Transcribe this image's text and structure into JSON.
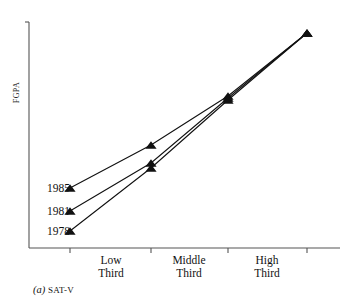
{
  "chart_data": {
    "type": "line",
    "title": "",
    "subtitle": "",
    "caption_prefix": "(a)",
    "caption_text": "SAT-V",
    "xlabel": "",
    "ylabel": "FGPA",
    "grid": false,
    "legend_position": "inline-left",
    "categories": [
      "",
      "Low Third",
      "Middle Third",
      "High Third"
    ],
    "tick_labels": [
      "Low Third",
      "Middle Third",
      "High Third"
    ],
    "x_ticks": [
      70,
      151,
      228,
      307
    ],
    "axis": {
      "x_start": 29,
      "x_end": 340,
      "y_top": 22,
      "y_bottom": 248,
      "y_tick_top": true,
      "y_tick_labels": []
    },
    "series": [
      {
        "name": "1985",
        "color": "#111111",
        "marker": "triangle-up",
        "label_x": 30,
        "label_y": 182,
        "points": [
          {
            "x": 70,
            "y": 188
          },
          {
            "x": 151,
            "y": 145
          },
          {
            "x": 228,
            "y": 96
          },
          {
            "x": 307,
            "y": 33
          }
        ]
      },
      {
        "name": "1981",
        "color": "#111111",
        "marker": "triangle-up",
        "label_x": 30,
        "label_y": 205,
        "points": [
          {
            "x": 70,
            "y": 211
          },
          {
            "x": 151,
            "y": 163
          },
          {
            "x": 228,
            "y": 98
          },
          {
            "x": 307,
            "y": 33
          }
        ]
      },
      {
        "name": "1978",
        "color": "#111111",
        "marker": "triangle-up",
        "label_x": 30,
        "label_y": 225,
        "points": [
          {
            "x": 70,
            "y": 231
          },
          {
            "x": 151,
            "y": 168
          },
          {
            "x": 228,
            "y": 100
          },
          {
            "x": 307,
            "y": 33
          }
        ]
      }
    ],
    "cat_label_positions": [
      {
        "label": "Low Third",
        "x": 76,
        "y": 254
      },
      {
        "label": "Middle Third",
        "x": 154,
        "y": 254
      },
      {
        "label": "High Third",
        "x": 232,
        "y": 254
      }
    ]
  },
  "colors": {
    "ink": "#111111",
    "axis": "#555555",
    "background": "#ffffff"
  }
}
